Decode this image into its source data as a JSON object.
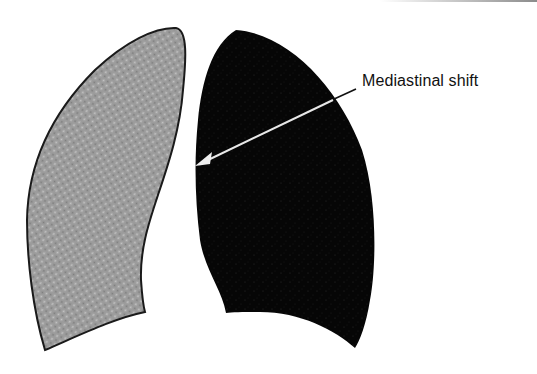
{
  "figure": {
    "left_lung": {
      "fill": "#9a9a9a",
      "outline": "#1a1a1a",
      "pattern": "stippled"
    },
    "right_lung": {
      "fill": "#0a0a0a"
    },
    "annotation": {
      "label": "Mediastinal shift",
      "arrow_color_inside": "#e8e8e8",
      "arrow_color_outside": "#111111"
    }
  }
}
